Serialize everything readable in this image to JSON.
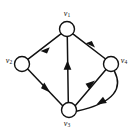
{
  "figure": {
    "type": "directed-graph",
    "background_color": "#ffffff",
    "stroke_color": "#111111",
    "node_fill_color": "#ffffff",
    "width": 134,
    "height": 131
  },
  "nodes": [
    {
      "id": "v1",
      "label": "v",
      "subscript": "1",
      "cx": 67,
      "cy": 29,
      "r": 7.5,
      "label_x": 67,
      "label_y": 14
    },
    {
      "id": "v2",
      "label": "v",
      "subscript": "2",
      "cx": 22,
      "cy": 64,
      "r": 7.5,
      "label_x": 8,
      "label_y": 60
    },
    {
      "id": "v3",
      "label": "v",
      "subscript": "3",
      "cx": 69,
      "cy": 110,
      "r": 7.5,
      "label_x": 69,
      "label_y": 124
    },
    {
      "id": "v4",
      "label": "v",
      "subscript": "4",
      "cx": 111,
      "cy": 64,
      "r": 7.5,
      "label_x": 124,
      "label_y": 60
    }
  ],
  "edges": [
    {
      "id": "e1",
      "from": "v1",
      "to": "v2",
      "shape": "straight",
      "arrow_at": "target"
    },
    {
      "id": "e2",
      "from": "v2",
      "to": "v3",
      "shape": "straight",
      "arrow_at": "target"
    },
    {
      "id": "e3",
      "from": "v3",
      "to": "v1",
      "shape": "straight",
      "arrow_at": "target"
    },
    {
      "id": "e4",
      "from": "v4",
      "to": "v1",
      "shape": "straight",
      "arrow_at": "target"
    },
    {
      "id": "e5",
      "from": "v3",
      "to": "v4",
      "shape": "straight",
      "arrow_at": "target"
    },
    {
      "id": "e6",
      "from": "v4",
      "to": "v3",
      "shape": "curved",
      "arrow_at": "target",
      "curve_direction": "outward-right"
    }
  ]
}
